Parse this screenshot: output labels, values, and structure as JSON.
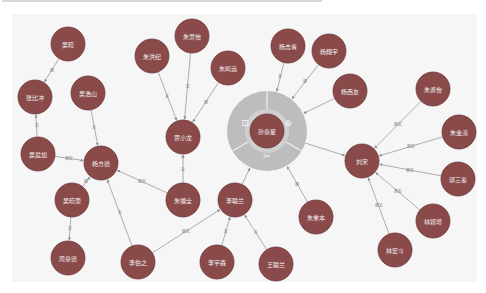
{
  "graph": {
    "colors": {
      "background": "#f6f6f6",
      "node_fill": "#8a4a4a",
      "node_stroke": "#6e3838",
      "edge": "#9a9a9a",
      "ring": "#bdbdbd",
      "ring_inner": "#d0d0d0",
      "label": "#f2f2f2"
    },
    "center_node": {
      "id": "n_center",
      "label": "孙泉星",
      "x": 267,
      "y": 131,
      "ring_menu": {
        "items": [
          {
            "name": "lock-icon",
            "glyph": "⊡",
            "label": ""
          },
          {
            "name": "expand-icon",
            "glyph": "⊕",
            "label": ""
          },
          {
            "name": "hide-icon",
            "glyph": "✂",
            "label": ""
          }
        ]
      }
    },
    "nodes": [
      {
        "id": "n1",
        "label": "吴晓",
        "x": 68,
        "y": 44
      },
      {
        "id": "n2",
        "label": "张比冲",
        "x": 35,
        "y": 97
      },
      {
        "id": "n3",
        "label": "吴浩山",
        "x": 88,
        "y": 93
      },
      {
        "id": "n4",
        "label": "吴晨加",
        "x": 38,
        "y": 154
      },
      {
        "id": "n5",
        "label": "杨方德",
        "x": 101,
        "y": 163
      },
      {
        "id": "n6",
        "label": "吴晓蕾",
        "x": 72,
        "y": 200
      },
      {
        "id": "n7",
        "label": "周泉德",
        "x": 68,
        "y": 258
      },
      {
        "id": "n8",
        "label": "朱洪纪",
        "x": 152,
        "y": 56
      },
      {
        "id": "n9",
        "label": "朱景怡",
        "x": 192,
        "y": 36
      },
      {
        "id": "n10",
        "label": "朱鸣远",
        "x": 228,
        "y": 68
      },
      {
        "id": "n11",
        "label": "贾小龙",
        "x": 183,
        "y": 137
      },
      {
        "id": "n12",
        "label": "朱福全",
        "x": 183,
        "y": 200
      },
      {
        "id": "n13",
        "label": "李伯之",
        "x": 138,
        "y": 262
      },
      {
        "id": "n14",
        "label": "李聪兰",
        "x": 235,
        "y": 200
      },
      {
        "id": "n15",
        "label": "李宇森",
        "x": 217,
        "y": 262
      },
      {
        "id": "n16",
        "label": "王聪兰",
        "x": 276,
        "y": 264
      },
      {
        "id": "n17",
        "label": "杨志青",
        "x": 288,
        "y": 46
      },
      {
        "id": "n18",
        "label": "杨翔宇",
        "x": 329,
        "y": 51
      },
      {
        "id": "n19",
        "label": "杨西友",
        "x": 350,
        "y": 91
      },
      {
        "id": "n20",
        "label": "朱重本",
        "x": 316,
        "y": 217
      },
      {
        "id": "n21",
        "label": "刘宋",
        "x": 362,
        "y": 161
      },
      {
        "id": "n22",
        "label": "朱勇怡",
        "x": 433,
        "y": 89
      },
      {
        "id": "n23",
        "label": "朱金涛",
        "x": 459,
        "y": 132
      },
      {
        "id": "n24",
        "label": "郭三秦",
        "x": 458,
        "y": 179
      },
      {
        "id": "n25",
        "label": "林颖增",
        "x": 433,
        "y": 221
      },
      {
        "id": "n26",
        "label": "林宏斗",
        "x": 395,
        "y": 250
      }
    ],
    "edges": [
      {
        "from": "n1",
        "to": "n2",
        "label": "朋"
      },
      {
        "from": "n4",
        "to": "n2",
        "label": "友"
      },
      {
        "from": "n3",
        "to": "n5",
        "label": "友"
      },
      {
        "from": "n4",
        "to": "n5",
        "label": "朋友"
      },
      {
        "from": "n6",
        "to": "n5",
        "label": "朋"
      },
      {
        "from": "n6",
        "to": "n7",
        "label": "友"
      },
      {
        "from": "n12",
        "to": "n5",
        "label": "朋友"
      },
      {
        "from": "n13",
        "to": "n5",
        "label": "友"
      },
      {
        "from": "n8",
        "to": "n11",
        "label": "友"
      },
      {
        "from": "n9",
        "to": "n11",
        "label": "友"
      },
      {
        "from": "n10",
        "to": "n11",
        "label": "朋"
      },
      {
        "from": "n12",
        "to": "n11",
        "label": "友"
      },
      {
        "from": "n13",
        "to": "n14",
        "label": "朋友"
      },
      {
        "from": "n15",
        "to": "n14",
        "label": "友"
      },
      {
        "from": "n16",
        "to": "n14",
        "label": "友"
      },
      {
        "from": "n14",
        "to": "n_center",
        "label": ""
      },
      {
        "from": "n17",
        "to": "n_center",
        "label": "友"
      },
      {
        "from": "n18",
        "to": "n_center",
        "label": "朋"
      },
      {
        "from": "n19",
        "to": "n_center",
        "label": ""
      },
      {
        "from": "n20",
        "to": "n_center",
        "label": "朋"
      },
      {
        "from": "n_center",
        "to": "n21",
        "label": ""
      },
      {
        "from": "n22",
        "to": "n21",
        "label": "朋友"
      },
      {
        "from": "n23",
        "to": "n21",
        "label": "朋友"
      },
      {
        "from": "n24",
        "to": "n21",
        "label": "朋友"
      },
      {
        "from": "n25",
        "to": "n21",
        "label": "朋友"
      },
      {
        "from": "n26",
        "to": "n21",
        "label": "朋友"
      }
    ]
  }
}
